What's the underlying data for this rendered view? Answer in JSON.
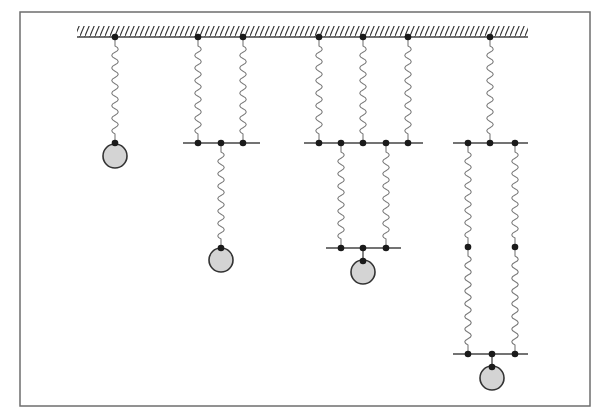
{
  "diagram": {
    "title": "",
    "type": "spring-mass systems",
    "colors": {
      "background": "#ffffff",
      "frame": "#6e6e6e",
      "line": "#444444",
      "spring": "#7a7a7a",
      "node": "#1a1a1a",
      "mass_fill": "#d4d4d4",
      "mass_stroke": "#333333"
    },
    "frame": {
      "x": 20,
      "y": 12,
      "w": 570,
      "h": 394
    },
    "ceiling": {
      "x1": 77,
      "x2": 528,
      "y": 37
    },
    "systems": [
      {
        "id": "single-spring",
        "label": "Single spring",
        "ceiling_anchors": [
          115
        ],
        "springs": [
          {
            "x": 115,
            "y1": 37,
            "y2": 143
          }
        ],
        "bars": [],
        "nodes": [
          [
            115,
            37
          ],
          [
            115,
            143
          ]
        ],
        "mass": {
          "cx": 115,
          "cy": 156,
          "r": 12
        }
      },
      {
        "id": "parallel-then-series",
        "label": "Two parallel springs in series with one spring",
        "ceiling_anchors": [
          198,
          243
        ],
        "springs": [
          {
            "x": 198,
            "y1": 37,
            "y2": 143
          },
          {
            "x": 243,
            "y1": 37,
            "y2": 143
          },
          {
            "x": 221,
            "y1": 143,
            "y2": 248
          }
        ],
        "bars": [
          {
            "x1": 183,
            "x2": 260,
            "y": 143
          }
        ],
        "nodes": [
          [
            198,
            37
          ],
          [
            243,
            37
          ],
          [
            198,
            143
          ],
          [
            221,
            143
          ],
          [
            243,
            143
          ],
          [
            221,
            248
          ]
        ],
        "mass": {
          "cx": 221,
          "cy": 260,
          "r": 12
        }
      },
      {
        "id": "three-parallel-then-two-parallel",
        "label": "Three parallel springs in series with two parallel springs",
        "ceiling_anchors": [
          319,
          363,
          408
        ],
        "springs": [
          {
            "x": 319,
            "y1": 37,
            "y2": 143
          },
          {
            "x": 363,
            "y1": 37,
            "y2": 143
          },
          {
            "x": 408,
            "y1": 37,
            "y2": 143
          },
          {
            "x": 341,
            "y1": 143,
            "y2": 248
          },
          {
            "x": 386,
            "y1": 143,
            "y2": 248
          }
        ],
        "bars": [
          {
            "x1": 304,
            "x2": 423,
            "y": 143
          },
          {
            "x1": 326,
            "x2": 401,
            "y": 248
          }
        ],
        "nodes": [
          [
            319,
            37
          ],
          [
            363,
            37
          ],
          [
            408,
            37
          ],
          [
            319,
            143
          ],
          [
            341,
            143
          ],
          [
            363,
            143
          ],
          [
            386,
            143
          ],
          [
            408,
            143
          ],
          [
            341,
            248
          ],
          [
            363,
            248
          ],
          [
            386,
            248
          ],
          [
            363,
            261
          ]
        ],
        "mass": {
          "cx": 363,
          "cy": 272,
          "r": 12
        },
        "mass_connector": {
          "x": 363,
          "y1": 248,
          "y2": 261
        }
      },
      {
        "id": "single-then-two-long-parallel",
        "label": "One spring in series with two parallel chains of two springs",
        "ceiling_anchors": [
          490
        ],
        "springs": [
          {
            "x": 490,
            "y1": 37,
            "y2": 143
          },
          {
            "x": 468,
            "y1": 143,
            "y2": 247
          },
          {
            "x": 515,
            "y1": 143,
            "y2": 247
          },
          {
            "x": 468,
            "y1": 247,
            "y2": 354
          },
          {
            "x": 515,
            "y1": 247,
            "y2": 354
          }
        ],
        "bars": [
          {
            "x1": 453,
            "x2": 528,
            "y": 143
          },
          {
            "x1": 453,
            "x2": 528,
            "y": 354
          }
        ],
        "nodes": [
          [
            490,
            37
          ],
          [
            468,
            143
          ],
          [
            490,
            143
          ],
          [
            515,
            143
          ],
          [
            468,
            247
          ],
          [
            515,
            247
          ],
          [
            468,
            354
          ],
          [
            492,
            354
          ],
          [
            515,
            354
          ],
          [
            492,
            367
          ]
        ],
        "mass": {
          "cx": 492,
          "cy": 378,
          "r": 12
        },
        "mass_connector": {
          "x": 492,
          "y1": 354,
          "y2": 367
        }
      }
    ]
  }
}
